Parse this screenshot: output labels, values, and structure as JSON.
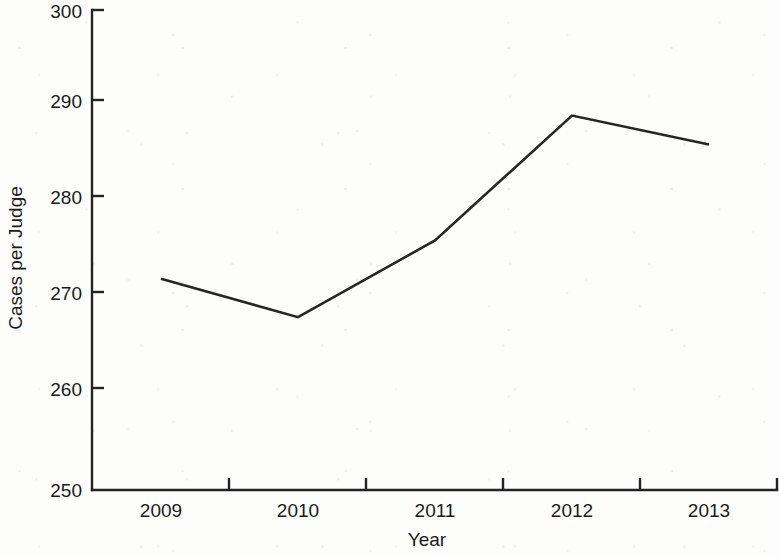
{
  "chart_data": {
    "type": "line",
    "title": "",
    "subtitle": "",
    "xlabel": "Year",
    "ylabel": "Cases per Judge",
    "categories": [
      "2009",
      "2010",
      "2011",
      "2012",
      "2013"
    ],
    "values": [
      272,
      268,
      276,
      289,
      286
    ],
    "series": [
      {
        "name": "Cases per Judge",
        "values": [
          272,
          268,
          276,
          289,
          286
        ]
      }
    ],
    "ylim": [
      250,
      300
    ],
    "y_ticks": [
      250,
      260,
      270,
      280,
      290,
      300
    ],
    "y_tick_labels": [
      "250",
      "260",
      "270",
      "280",
      "290",
      "300"
    ],
    "x_tick_labels": [
      "2009",
      "2010",
      "2011",
      "2012",
      "2013"
    ],
    "grid": false,
    "legend": false,
    "legend_position": "none",
    "markers": false,
    "annotations": [],
    "line_color": "#262626",
    "axis_color": "#232323",
    "background_color": "#fdfdfc"
  },
  "axes": {
    "y_title": "Cases per Judge",
    "x_title": "Year",
    "y_labels": [
      "300",
      "290",
      "280",
      "270",
      "260",
      "250"
    ],
    "x_labels": [
      "2009",
      "2010",
      "2011",
      "2012",
      "2013"
    ]
  }
}
